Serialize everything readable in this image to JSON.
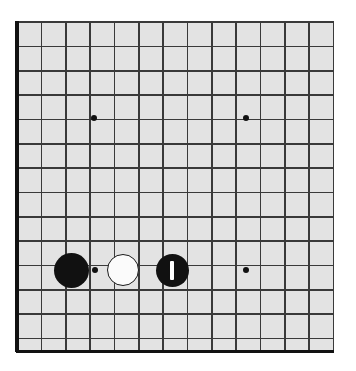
{
  "figure": {
    "kind": "go-board-diagram",
    "board_size_label": "19x19",
    "visible_columns": 14,
    "visible_rows": 14
  },
  "colors": {
    "board_background": "#e3e3e3",
    "page_background": "#ffffff",
    "grid_line": "#3a3a3a",
    "border_line": "#111111",
    "black_stone": "#111111",
    "white_stone": "#fbfbfb",
    "white_stone_outline": "#1a1a1a",
    "hoshi": "#111111",
    "mark": "#ffffff"
  },
  "geometry": {
    "origin_x": 17,
    "origin_y": 22,
    "spacing": 24.35,
    "line_width": 1.7,
    "border_width": 3.2,
    "board_left": 17,
    "board_top": 21,
    "board_right": 333,
    "board_bottom": 352,
    "stone_radius": 17,
    "small_stone_radius": 15,
    "hoshi_radius": 3.4
  },
  "grid": {
    "vertical_lines_x": [
      17,
      41.4,
      65.7,
      90.1,
      114.4,
      138.8,
      163.1,
      187.5,
      211.8,
      236.2,
      260.5,
      284.9,
      309.2,
      333.6
    ],
    "horizontal_lines_y": [
      22,
      46.4,
      70.7,
      95.1,
      119.4,
      143.8,
      168.1,
      192.5,
      216.8,
      241.2,
      265.5,
      289.9,
      314.2,
      338.6
    ],
    "left_border_x": 17,
    "bottom_border_y": 351.5
  },
  "hoshi_points": [
    {
      "name": "star-point-upper-left",
      "x": 94,
      "y": 118,
      "r": 3.4
    },
    {
      "name": "star-point-upper-right",
      "x": 246,
      "y": 118,
      "r": 3.4
    },
    {
      "name": "star-point-lower-left",
      "x": 95,
      "y": 270,
      "r": 3.4
    },
    {
      "name": "star-point-lower-right",
      "x": 246,
      "y": 270,
      "r": 3.4
    }
  ],
  "stones": [
    {
      "name": "black-stone-left",
      "color": "black",
      "x": 71,
      "y": 270,
      "r": 17.5,
      "mark": "none",
      "label": ""
    },
    {
      "name": "white-stone-center",
      "color": "white",
      "x": 123,
      "y": 270,
      "r": 16,
      "mark": "none",
      "label": ""
    },
    {
      "name": "black-stone-marked",
      "color": "black",
      "x": 172,
      "y": 270,
      "r": 16.5,
      "mark": "vertical-bar",
      "label": ""
    }
  ],
  "marks": {
    "vertical_bar": {
      "width": 3.6,
      "height": 19,
      "color": "#ffffff"
    }
  }
}
